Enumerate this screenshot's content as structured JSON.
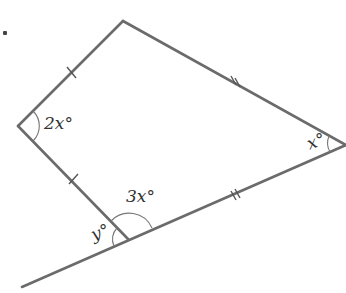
{
  "diagram": {
    "type": "kite-with-extended-side",
    "question_marker": ".",
    "stroke_color": "#6b6b6b",
    "vertices": {
      "top": [
        123,
        21
      ],
      "left": [
        18,
        126
      ],
      "bottom": [
        128,
        239
      ],
      "right": [
        346,
        145
      ]
    },
    "extension_end": [
      22,
      287
    ],
    "angle_labels": {
      "left": "2x°",
      "right": "x°",
      "bottom_interior": "3x°",
      "bottom_exterior": "y°"
    },
    "tick_marks": {
      "top_left_side": "single",
      "left_bottom_side": "single",
      "top_right_side": "double",
      "bottom_right_side": "double"
    }
  }
}
